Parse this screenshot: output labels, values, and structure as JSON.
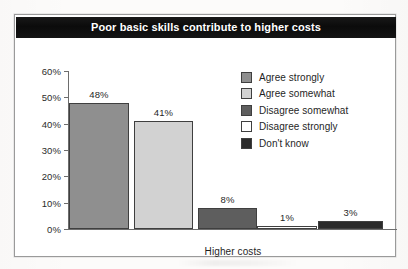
{
  "figure": {
    "title": "Poor basic skills contribute to higher costs",
    "xlabel": "Higher costs"
  },
  "legend": {
    "items": [
      {
        "label": "Agree strongly",
        "color": "#8f8f8f"
      },
      {
        "label": "Agree somewhat",
        "color": "#d2d2d2"
      },
      {
        "label": "Disagree somewhat",
        "color": "#5e5e5e"
      },
      {
        "label": "Disagree strongly",
        "color": "#ffffff"
      },
      {
        "label": "Don't know",
        "color": "#2b2b2b"
      }
    ]
  },
  "axis": {
    "yticks": [
      "60%",
      "50%",
      "40%",
      "30%",
      "20%",
      "10%",
      "0%"
    ]
  },
  "chart_data": {
    "type": "bar",
    "title": "Poor basic skills contribute to higher costs",
    "xlabel": "Higher costs",
    "ylabel": "",
    "categories": [
      "Agree strongly",
      "Agree somewhat",
      "Disagree somewhat",
      "Disagree strongly",
      "Don't know"
    ],
    "values": [
      48,
      41,
      8,
      1,
      3
    ],
    "value_labels": [
      "48%",
      "41%",
      "8%",
      "1%",
      "3%"
    ],
    "colors": [
      "#8f8f8f",
      "#d2d2d2",
      "#5e5e5e",
      "#ffffff",
      "#2b2b2b"
    ],
    "ylim": [
      0,
      60
    ],
    "ytick_values": [
      0,
      10,
      20,
      30,
      40,
      50,
      60
    ],
    "ytick_labels": [
      "0%",
      "10%",
      "20%",
      "30%",
      "40%",
      "50%",
      "60%"
    ],
    "grid": false,
    "legend_position": "inside-upper-right",
    "units": "percent"
  }
}
